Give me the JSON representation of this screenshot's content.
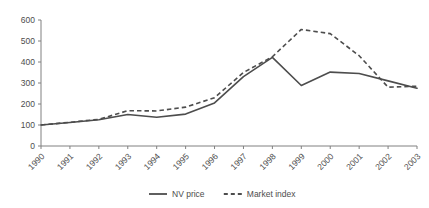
{
  "chart_data": {
    "type": "line",
    "title": "",
    "subtitle": "",
    "xlabel": "",
    "ylabel": "",
    "categories": [
      "1990",
      "1991",
      "1992",
      "1993",
      "1994",
      "1995",
      "1996",
      "1997",
      "1998",
      "1999",
      "2000",
      "2001",
      "2002",
      "2003"
    ],
    "ylim": [
      0,
      600
    ],
    "ytick_values": [
      0,
      100,
      200,
      300,
      400,
      500,
      600
    ],
    "ytick_labels": [
      "0",
      "100",
      "200",
      "300",
      "400",
      "500",
      "600"
    ],
    "grid": false,
    "legend_position": "bottom-center",
    "xtick_label_rotation": 45,
    "series": [
      {
        "name": "NV price",
        "style": "solid",
        "color": "#4d4d4d",
        "values": [
          100,
          112,
          125,
          150,
          137,
          152,
          205,
          330,
          422,
          288,
          352,
          345,
          310,
          275
        ]
      },
      {
        "name": "Market index",
        "style": "dashed",
        "color": "#4d4d4d",
        "values": [
          100,
          113,
          127,
          168,
          167,
          185,
          230,
          350,
          425,
          555,
          535,
          430,
          280,
          285
        ]
      }
    ]
  },
  "legend": {
    "items": [
      {
        "label": "NV price",
        "style": "solid"
      },
      {
        "label": "Market index",
        "style": "dashed"
      }
    ]
  },
  "colors": {
    "axis": "#808080",
    "text": "#4d4d4d",
    "series": "#4d4d4d",
    "background": "#ffffff"
  }
}
